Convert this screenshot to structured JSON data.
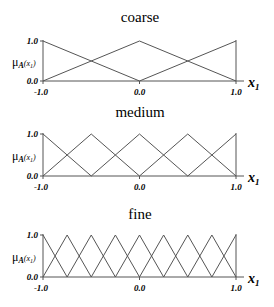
{
  "chart_data": [
    {
      "type": "line",
      "title": "coarse",
      "xlabel": "x1",
      "ylabel": "μA(x1)",
      "xlim": [
        -1.0,
        1.0
      ],
      "ylim": [
        0.0,
        1.0
      ],
      "x_tick_labels": [
        "-1.0",
        "0.0",
        "1.0"
      ],
      "y_tick_labels": [
        "0.0",
        "1.0"
      ],
      "peaks": [
        -1.0,
        0.0,
        1.0
      ],
      "grid": false
    },
    {
      "type": "line",
      "title": "medium",
      "xlabel": "x1",
      "ylabel": "μA(x1)",
      "xlim": [
        -1.0,
        1.0
      ],
      "ylim": [
        0.0,
        1.0
      ],
      "x_tick_labels": [
        "-1.0",
        "0.0",
        "1.0"
      ],
      "y_tick_labels": [
        "0.0",
        "1.0"
      ],
      "peaks": [
        -1.0,
        -0.5,
        0.0,
        0.5,
        1.0
      ],
      "grid": false
    },
    {
      "type": "line",
      "title": "fine",
      "xlabel": "x1",
      "ylabel": "μA(x1)",
      "xlim": [
        -1.0,
        1.0
      ],
      "ylim": [
        0.0,
        1.0
      ],
      "x_tick_labels": [
        "-1.0",
        "0.0",
        "1.0"
      ],
      "y_tick_labels": [
        "0.0",
        "1.0"
      ],
      "peaks": [
        -1.0,
        -0.75,
        -0.5,
        -0.25,
        0.0,
        0.25,
        0.5,
        0.75,
        1.0
      ],
      "grid": false
    }
  ],
  "panels": [
    {
      "title": "coarse",
      "y_top": "1.0",
      "y_bottom": "0.0",
      "x_left": "-1.0",
      "x_mid": "0.0",
      "x_right": "1.0",
      "mu": "μ",
      "mu_sub": "A",
      "mu_arg": "(x",
      "mu_arg_sub": "1",
      "mu_close": ")",
      "x_label": "x",
      "x_label_sub": "1"
    },
    {
      "title": "medium",
      "y_top": "1.0",
      "y_bottom": "0.0",
      "x_left": "-1.0",
      "x_mid": "0.0",
      "x_right": "1.0",
      "mu": "μ",
      "mu_sub": "A",
      "mu_arg": "(x",
      "mu_arg_sub": "1",
      "mu_close": ")",
      "x_label": "x",
      "x_label_sub": "1"
    },
    {
      "title": "fine",
      "y_top": "1.0",
      "y_bottom": "0.0",
      "x_left": "-1.0",
      "x_mid": "0.0",
      "x_right": "1.0",
      "mu": "μ",
      "mu_sub": "A",
      "mu_arg": "(x",
      "mu_arg_sub": "1",
      "mu_close": ")",
      "x_label": "x",
      "x_label_sub": "1"
    }
  ]
}
